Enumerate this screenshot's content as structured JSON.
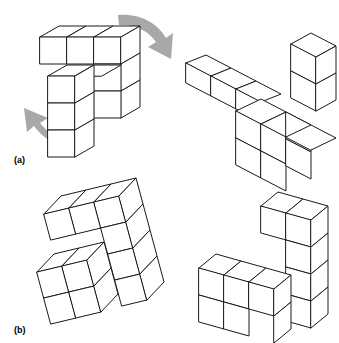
{
  "figure": {
    "background_color": "#ffffff",
    "line_color": "#1a1a1a",
    "face_color": "#ffffff",
    "arrow_color": "#a8a8a8",
    "width": 339,
    "height": 343
  },
  "panels": [
    {
      "id": "a",
      "label": "(a)",
      "label_x": 14,
      "label_y": 163,
      "figures": [
        "left-solid-a",
        "right-solid-a"
      ]
    },
    {
      "id": "b",
      "label": "(b)",
      "label_x": 14,
      "label_y": 333,
      "figures": [
        "left-solid-b",
        "right-solid-b"
      ]
    }
  ],
  "arrows": [
    {
      "name": "rotation-arrow-top-right",
      "direction": "down-right",
      "color": "#a8a8a8",
      "path": "M118,15 C138,13 157,22 166,38 L173,33 L171,59 L148,47 L156,42 C148,30 134,24 119,25 Z"
    },
    {
      "name": "rotation-arrow-bottom-left",
      "direction": "up-left",
      "color": "#a8a8a8",
      "path": "M63,146 C52,143 41,136 34,126 L27,132 L24,108 L48,118 L40,123 C46,131 55,137 65,139 Z"
    }
  ],
  "solids": [
    {
      "name": "left-solid-a",
      "description": "L-shaped cube assembly, panel a, left view",
      "faces": [
        {
          "type": "top",
          "points": "40,37 59,26 86,26 67,37"
        },
        {
          "type": "top",
          "points": "67,37 86,26 113,26 94,37"
        },
        {
          "type": "top",
          "points": "94,37 113,26 140,26 121,37"
        },
        {
          "type": "front",
          "points": "40,37 67,37 67,64 40,64"
        },
        {
          "type": "front",
          "points": "67,37 94,37 94,64 67,64"
        },
        {
          "type": "front",
          "points": "94,37 121,37 121,64 94,64"
        },
        {
          "type": "side",
          "points": "121,37 140,26 140,53 121,64"
        },
        {
          "type": "side",
          "points": "121,64 140,53 140,80 121,91"
        },
        {
          "type": "side",
          "points": "121,91 140,80 140,107 121,118"
        },
        {
          "type": "front",
          "points": "94,64 121,64 121,91 94,91"
        },
        {
          "type": "front",
          "points": "94,91 121,91 121,118 94,118"
        },
        {
          "type": "top",
          "points": "48,76 67,65 94,65 75,76"
        },
        {
          "type": "top",
          "points": "75,76 94,65 121,65 102,76"
        },
        {
          "type": "front",
          "points": "48,76 75,76 75,103 48,103"
        },
        {
          "type": "front",
          "points": "48,103 75,103 75,130 48,130"
        },
        {
          "type": "front",
          "points": "48,130 75,130 75,157 48,157"
        },
        {
          "type": "side",
          "points": "75,76 94,65 94,92 75,103"
        },
        {
          "type": "side",
          "points": "75,103 94,92 94,119 75,130"
        },
        {
          "type": "side",
          "points": "75,130 94,119 94,146 75,157"
        }
      ]
    },
    {
      "name": "right-solid-a",
      "description": "Rotated L-shaped cube assembly, panel a, right view",
      "faces": [
        {
          "type": "top",
          "points": "186,63 206,55 231,68 211,76"
        },
        {
          "type": "top",
          "points": "211,76 231,68 256,81 236,89"
        },
        {
          "type": "top",
          "points": "236,89 256,81 281,94 261,102"
        },
        {
          "type": "front",
          "points": "186,63 211,76 211,96 186,83"
        },
        {
          "type": "front",
          "points": "211,76 236,89 236,109 211,96"
        },
        {
          "type": "front",
          "points": "236,89 261,102 261,122 236,109"
        },
        {
          "type": "top",
          "points": "236,111 261,99 286,112 261,124"
        },
        {
          "type": "top",
          "points": "261,124 286,112 311,125 286,137"
        },
        {
          "type": "front",
          "points": "236,111 261,124 261,151 236,138"
        },
        {
          "type": "front",
          "points": "261,124 286,137 286,164 261,151"
        },
        {
          "type": "front",
          "points": "236,138 261,151 261,178 236,165"
        },
        {
          "type": "front",
          "points": "261,151 286,164 286,191 261,178"
        },
        {
          "type": "side",
          "points": "286,112 311,125 311,152 286,139"
        },
        {
          "type": "side",
          "points": "286,139 311,152 311,179 286,166"
        },
        {
          "type": "top",
          "points": "291,44 311,33 336,46 316,57"
        },
        {
          "type": "front",
          "points": "291,44 316,57 316,84 291,71"
        },
        {
          "type": "front",
          "points": "291,71 316,84 316,111 291,98"
        },
        {
          "type": "side",
          "points": "316,57 336,46 336,73 316,84"
        },
        {
          "type": "side",
          "points": "316,84 336,73 336,100 316,111"
        },
        {
          "type": "front",
          "points": "286,137 311,125 336,138 311,150"
        }
      ]
    },
    {
      "name": "left-solid-b",
      "description": "Tilted L-shaped cube assembly, panel b, left view",
      "faces": [
        {
          "type": "top",
          "points": "44,214 61,196 86,190 69,208"
        },
        {
          "type": "top",
          "points": "69,208 86,190 111,184 94,202"
        },
        {
          "type": "top",
          "points": "94,202 111,184 136,178 119,196"
        },
        {
          "type": "front",
          "points": "44,214 69,208 76,234 51,240"
        },
        {
          "type": "front",
          "points": "69,208 94,202 101,228 76,234"
        },
        {
          "type": "front",
          "points": "94,202 119,196 126,222 101,228"
        },
        {
          "type": "side",
          "points": "119,196 136,178 143,204 126,222"
        },
        {
          "type": "front",
          "points": "101,228 126,222 133,248 108,254"
        },
        {
          "type": "side",
          "points": "126,222 143,204 150,230 133,248"
        },
        {
          "type": "front",
          "points": "108,254 133,248 140,274 115,280"
        },
        {
          "type": "side",
          "points": "133,248 150,230 157,256 140,274"
        },
        {
          "type": "front",
          "points": "115,280 140,274 147,300 122,306"
        },
        {
          "type": "side",
          "points": "140,274 157,256 164,282 147,300"
        },
        {
          "type": "top",
          "points": "37,272 54,254 79,248 62,266"
        },
        {
          "type": "top",
          "points": "62,266 79,248 104,242 87,260"
        },
        {
          "type": "front",
          "points": "37,272 62,266 69,292 44,298"
        },
        {
          "type": "front",
          "points": "62,266 87,260 94,286 69,292"
        },
        {
          "type": "front",
          "points": "44,298 69,292 76,318 51,324"
        },
        {
          "type": "front",
          "points": "69,292 94,286 101,312 76,318"
        },
        {
          "type": "side",
          "points": "87,260 104,242 111,268 94,286"
        },
        {
          "type": "side",
          "points": "94,286 111,268 118,294 101,312"
        }
      ]
    },
    {
      "name": "right-solid-b",
      "description": "Tilted L-shaped cube assembly, panel b, right view",
      "faces": [
        {
          "type": "top",
          "points": "261,206 278,192 303,199 286,213"
        },
        {
          "type": "top",
          "points": "286,213 303,199 328,206 311,220"
        },
        {
          "type": "front",
          "points": "261,206 286,213 286,240 261,233"
        },
        {
          "type": "front",
          "points": "286,213 311,220 311,247 286,240"
        },
        {
          "type": "side",
          "points": "311,220 328,206 328,233 311,247"
        },
        {
          "type": "front",
          "points": "286,240 311,247 311,274 286,267"
        },
        {
          "type": "side",
          "points": "311,247 328,233 328,260 311,274"
        },
        {
          "type": "front",
          "points": "286,267 311,274 311,301 286,294"
        },
        {
          "type": "side",
          "points": "311,274 328,260 328,287 311,301"
        },
        {
          "type": "front",
          "points": "286,294 311,301 311,328 286,321"
        },
        {
          "type": "side",
          "points": "311,301 328,287 328,314 311,328"
        },
        {
          "type": "top",
          "points": "199,268 216,254 241,261 224,275"
        },
        {
          "type": "top",
          "points": "224,275 241,261 266,268 249,282"
        },
        {
          "type": "top",
          "points": "249,282 266,268 291,275 274,289"
        },
        {
          "type": "front",
          "points": "199,268 224,275 224,302 199,295"
        },
        {
          "type": "front",
          "points": "224,275 249,282 249,309 224,302"
        },
        {
          "type": "front",
          "points": "249,282 274,289 274,316 249,309"
        },
        {
          "type": "front",
          "points": "199,295 224,302 224,329 199,322"
        },
        {
          "type": "front",
          "points": "224,302 249,309 249,336 224,329"
        },
        {
          "type": "side",
          "points": "274,289 291,275 291,302 274,316"
        },
        {
          "type": "side",
          "points": "274,316 291,302 291,329 274,343"
        }
      ]
    }
  ]
}
